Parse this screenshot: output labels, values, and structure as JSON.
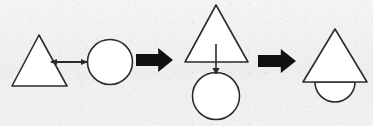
{
  "canvas": {
    "width": 373,
    "height": 126,
    "background_color": "#f2f1ef",
    "stroke_color": "#2b2b2b",
    "fill_color": "#ffffff",
    "arrow_color": "#111111"
  },
  "diagram": {
    "type": "shape-transformation-sequence",
    "panels": [
      {
        "name": "panel-1-attraction",
        "label": "",
        "shapes": [
          {
            "kind": "triangle",
            "name": "triangle-left",
            "fill": "#ffffff",
            "stroke": "#2b2b2b",
            "stroke_width": 1.6,
            "points": "39,35 67,86 12,86"
          },
          {
            "kind": "circle",
            "name": "circle-left",
            "fill": "#ffffff",
            "stroke": "#2b2b2b",
            "stroke_width": 1.6,
            "cx": 110,
            "cy": 62,
            "r": 22.5
          },
          {
            "kind": "double-headed-arrow",
            "name": "attraction-arrow",
            "stroke": "#2b2b2b",
            "stroke_width": 2.0,
            "x1": 51,
            "y1": 62,
            "x2": 87,
            "y2": 62
          }
        ]
      },
      {
        "name": "panel-2-alignment",
        "label": "",
        "shapes": [
          {
            "kind": "triangle",
            "name": "triangle-middle",
            "fill": "#ffffff",
            "stroke": "#2b2b2b",
            "stroke_width": 1.6,
            "points": "216,5 248,62 185,62"
          },
          {
            "kind": "circle",
            "name": "circle-middle",
            "fill": "#ffffff",
            "stroke": "#2b2b2b",
            "stroke_width": 1.6,
            "cx": 216,
            "cy": 96,
            "r": 23.5
          },
          {
            "kind": "arrow",
            "name": "motion-arrow-down",
            "stroke": "#2b2b2b",
            "stroke_width": 1.6,
            "x1": 216,
            "y1": 44,
            "x2": 216,
            "y2": 74
          }
        ]
      },
      {
        "name": "panel-3-merged",
        "label": "",
        "shapes": [
          {
            "kind": "triangle",
            "name": "triangle-right",
            "fill": "#ffffff",
            "stroke": "#2b2b2b",
            "stroke_width": 1.6,
            "points": "335,29 367,82 303,82"
          },
          {
            "kind": "semicircle",
            "name": "semicircle-bottom",
            "fill": "#ffffff",
            "stroke": "#2b2b2b",
            "stroke_width": 1.6,
            "cx": 335,
            "cy": 82,
            "r": 20,
            "orientation": "down"
          }
        ]
      }
    ],
    "connectors": [
      {
        "kind": "block-arrow",
        "name": "step-arrow-1",
        "fill": "#111111",
        "direction": "right",
        "x": 136,
        "y": 48,
        "width": 37,
        "height": 24
      },
      {
        "kind": "block-arrow",
        "name": "step-arrow-2",
        "fill": "#111111",
        "direction": "right",
        "x": 258,
        "y": 49,
        "width": 38,
        "height": 24
      }
    ]
  }
}
